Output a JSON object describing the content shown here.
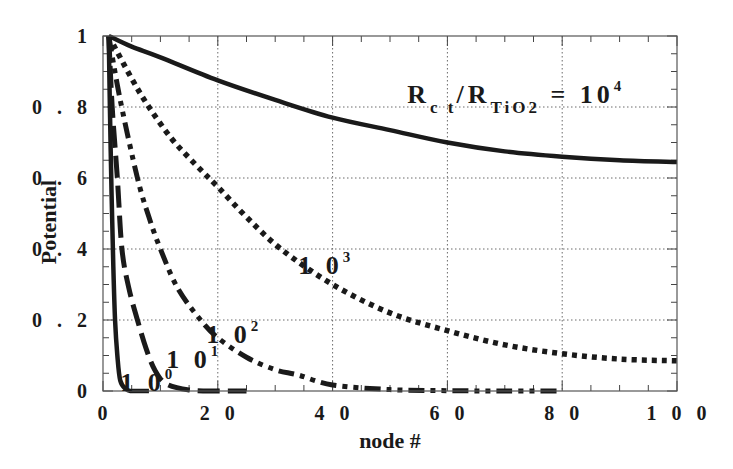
{
  "chart_data": {
    "type": "line",
    "title": "",
    "xlabel": "node #",
    "ylabel": "Potential",
    "xlim": [
      0,
      100
    ],
    "ylim": [
      0,
      1
    ],
    "xticks": [
      0,
      20,
      40,
      60,
      80,
      100
    ],
    "yticks": [
      0,
      0.2,
      0.4,
      0.6,
      0.8,
      1
    ],
    "xtick_labels": [
      "0",
      "2 0",
      "4 0",
      "6 0",
      "8 0",
      "1 0 0"
    ],
    "ytick_labels": [
      "0",
      "0 . 2",
      "0 . 4",
      "0 . 6",
      "0 . 8",
      "1"
    ],
    "grid": true,
    "legend": "inline curve labels",
    "annotation": "Rct/RTiO2 = 10^4",
    "series": [
      {
        "name": "10^4",
        "style": "solid",
        "x": [
          1,
          5,
          10,
          20,
          30,
          40,
          50,
          60,
          70,
          80,
          90,
          100
        ],
        "y": [
          1.0,
          0.97,
          0.94,
          0.875,
          0.82,
          0.77,
          0.735,
          0.7,
          0.675,
          0.66,
          0.65,
          0.645
        ]
      },
      {
        "name": "10^3",
        "style": "dotted",
        "x": [
          1,
          5,
          8,
          12,
          16,
          20,
          25,
          31,
          40,
          50,
          60,
          70,
          80,
          90,
          100
        ],
        "y": [
          1.0,
          0.88,
          0.8,
          0.71,
          0.64,
          0.575,
          0.49,
          0.4,
          0.3,
          0.22,
          0.17,
          0.13,
          0.105,
          0.09,
          0.085
        ]
      },
      {
        "name": "10^2",
        "style": "dash-dot-dot",
        "x": [
          1,
          3,
          6,
          8,
          10,
          13,
          17,
          20,
          25,
          30,
          34,
          40,
          50,
          60,
          70,
          80
        ],
        "y": [
          1.0,
          0.82,
          0.6,
          0.49,
          0.4,
          0.29,
          0.2,
          0.15,
          0.095,
          0.06,
          0.045,
          0.017,
          0.004,
          0.001,
          0.0,
          0.0
        ]
      },
      {
        "name": "10^1",
        "style": "long-dash",
        "x": [
          1,
          1.6,
          2.5,
          3.3,
          4.5,
          6,
          7.5,
          9,
          11,
          15,
          20,
          25
        ],
        "y": [
          1.0,
          0.8,
          0.6,
          0.4,
          0.29,
          0.2,
          0.12,
          0.06,
          0.02,
          0.003,
          0.0,
          0.0
        ]
      },
      {
        "name": "10^0",
        "style": "solid",
        "x": [
          1,
          1.2,
          1.5,
          1.8,
          2.1,
          2.5,
          3,
          4,
          5,
          8
        ],
        "y": [
          1.0,
          0.8,
          0.55,
          0.35,
          0.2,
          0.1,
          0.03,
          0.005,
          0.0,
          0.0
        ]
      }
    ],
    "curve_labels": [
      {
        "series": "10^4",
        "base": "R",
        "sub1": "c t",
        "slash": "/R",
        "sub2": "TiO2",
        "eq": " = ",
        "val": "10",
        "sup": "4",
        "x": 53,
        "y": 0.81
      },
      {
        "series": "10^3",
        "base": "1 0",
        "sup": "3",
        "x": 34,
        "y": 0.33
      },
      {
        "series": "10^2",
        "base": "1 0",
        "sup": "2",
        "x": 18,
        "y": 0.135
      },
      {
        "series": "10^1",
        "base": "1 0",
        "sup": "1",
        "x": 11,
        "y": 0.065
      },
      {
        "series": "10^0",
        "base": "1 0",
        "sup": "0",
        "x": 3,
        "y": 0.0
      }
    ]
  },
  "colors": {
    "ink": "#1a1a1a",
    "grid": "#6a6a6a",
    "frame": "#555555",
    "background": "#ffffff"
  }
}
